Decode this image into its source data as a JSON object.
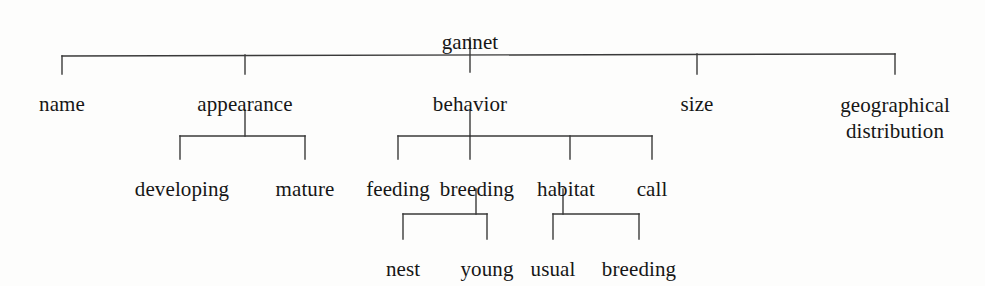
{
  "diagram": {
    "title": "gannet",
    "type": "tree-diagram",
    "line_color": "#3a3a3a",
    "text_color": "#161616",
    "background_color": "#fdfdfc",
    "root": {
      "id": "gannet",
      "label": "gannet",
      "x": 470,
      "y": 30,
      "level": 0
    },
    "nodes": [
      {
        "id": "name",
        "label": "name",
        "x": 62,
        "y": 92,
        "level": 1,
        "parent": "gannet"
      },
      {
        "id": "appearance",
        "label": "appearance",
        "x": 245,
        "y": 92,
        "level": 1,
        "parent": "gannet"
      },
      {
        "id": "behavior",
        "label": "behavior",
        "x": 470,
        "y": 92,
        "level": 1,
        "parent": "gannet"
      },
      {
        "id": "size",
        "label": "size",
        "x": 697,
        "y": 92,
        "level": 1,
        "parent": "gannet"
      },
      {
        "id": "geographical-distribution",
        "label": "geographical",
        "label2": "distribution",
        "x": 895,
        "y": 92,
        "level": 1,
        "parent": "gannet",
        "lines": 2
      },
      {
        "id": "developing",
        "label": "developing",
        "x": 182,
        "y": 177,
        "level": 2,
        "parent": "appearance"
      },
      {
        "id": "mature",
        "label": "mature",
        "x": 305,
        "y": 177,
        "level": 2,
        "parent": "appearance"
      },
      {
        "id": "feeding",
        "label": "feeding",
        "x": 398,
        "y": 177,
        "level": 2,
        "parent": "behavior"
      },
      {
        "id": "breeding",
        "label": "breeding",
        "x": 477,
        "y": 177,
        "level": 2,
        "parent": "behavior"
      },
      {
        "id": "habitat",
        "label": "habitat",
        "x": 566,
        "y": 177,
        "level": 2,
        "parent": "behavior"
      },
      {
        "id": "call",
        "label": "call",
        "x": 652,
        "y": 177,
        "level": 2,
        "parent": "behavior"
      },
      {
        "id": "nest",
        "label": "nest",
        "x": 403,
        "y": 257,
        "level": 3,
        "parent": "breeding"
      },
      {
        "id": "young",
        "label": "young",
        "x": 487,
        "y": 257,
        "level": 3,
        "parent": "breeding"
      },
      {
        "id": "usual",
        "label": "usual",
        "x": 553,
        "y": 257,
        "level": 3,
        "parent": "habitat"
      },
      {
        "id": "breeding-habitat",
        "label": "breeding",
        "x": 639,
        "y": 257,
        "level": 3,
        "parent": "habitat"
      }
    ],
    "edges": [
      {
        "id": "trunk-gannet",
        "from": "gannet",
        "to": "level1-bar",
        "points": "470,38 470,72"
      },
      {
        "id": "bar-level1",
        "from": "level1-bar",
        "to": "children",
        "points": "62,56 895,54"
      },
      {
        "id": "stem-name",
        "from": "level1-bar",
        "to": "name",
        "points": "62,56 62,74"
      },
      {
        "id": "stem-appearance",
        "from": "level1-bar",
        "to": "appearance",
        "points": "245,55 245,74"
      },
      {
        "id": "stem-size",
        "from": "level1-bar",
        "to": "size",
        "points": "697,54 697,74"
      },
      {
        "id": "stem-geographical",
        "from": "level1-bar",
        "to": "geographical-distribution",
        "points": "895,54 895,74"
      },
      {
        "id": "stem-appearance-down",
        "from": "appearance",
        "to": "appearance-bar",
        "points": "245,110 245,136"
      },
      {
        "id": "bar-appearance",
        "from": "appearance-bar",
        "to": "children",
        "points": "180,136 305,136"
      },
      {
        "id": "stem-developing",
        "from": "appearance-bar",
        "to": "developing",
        "points": "180,136 180,159"
      },
      {
        "id": "stem-mature",
        "from": "appearance-bar",
        "to": "mature",
        "points": "305,136 305,159"
      },
      {
        "id": "stem-behavior-down",
        "from": "behavior",
        "to": "behavior-bar",
        "points": "470,110 470,136"
      },
      {
        "id": "bar-behavior",
        "from": "behavior-bar",
        "to": "children",
        "points": "398,136 652,136"
      },
      {
        "id": "stem-feeding",
        "from": "behavior-bar",
        "to": "feeding",
        "points": "398,136 398,159"
      },
      {
        "id": "stem-breeding",
        "from": "behavior-bar",
        "to": "breeding",
        "points": "470,136 470,159"
      },
      {
        "id": "stem-habitat",
        "from": "behavior-bar",
        "to": "habitat",
        "points": "570,136 570,159"
      },
      {
        "id": "stem-call",
        "from": "behavior-bar",
        "to": "call",
        "points": "652,136 652,159"
      },
      {
        "id": "stem-breeding-down",
        "from": "breeding",
        "to": "breeding-bar",
        "points": "476,189 476,214"
      },
      {
        "id": "bar-breeding",
        "from": "breeding-bar",
        "to": "children",
        "points": "403,214 487,214"
      },
      {
        "id": "stem-nest",
        "from": "breeding-bar",
        "to": "nest",
        "points": "403,214 403,239"
      },
      {
        "id": "stem-young",
        "from": "breeding-bar",
        "to": "young",
        "points": "487,214 487,239"
      },
      {
        "id": "stem-habitat-down",
        "from": "habitat",
        "to": "habitat-bar",
        "points": "563,189 563,214"
      },
      {
        "id": "bar-habitat",
        "from": "habitat-bar",
        "to": "children",
        "points": "553,214 639,214"
      },
      {
        "id": "stem-usual",
        "from": "habitat-bar",
        "to": "usual",
        "points": "553,214 553,239"
      },
      {
        "id": "stem-breeding-habitat",
        "from": "habitat-bar",
        "to": "breeding-habitat",
        "points": "639,214 639,239"
      }
    ]
  }
}
